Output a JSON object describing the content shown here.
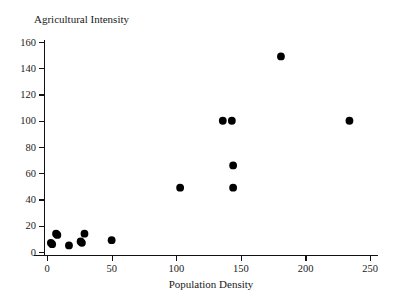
{
  "chart_data": {
    "type": "scatter",
    "title": "",
    "xlabel": "Population Density",
    "ylabel": "Agricultural Intensity",
    "xlim": [
      -10,
      258
    ],
    "ylim": [
      -4,
      164
    ],
    "xticks": [
      0,
      50,
      100,
      150,
      200,
      250
    ],
    "yticks": [
      0,
      20,
      40,
      60,
      80,
      100,
      120,
      140,
      160
    ],
    "xtick_labels": [
      "0",
      "50",
      "100",
      "150",
      "200",
      "250"
    ],
    "ytick_labels": [
      "0",
      "20",
      "40",
      "60",
      "80",
      "100",
      "120",
      "140",
      "160"
    ],
    "grid": false,
    "legend": null,
    "marker": "filled-circle",
    "marker_color": "#000000",
    "marker_size": 5.2,
    "points": [
      {
        "x": 3,
        "y": 7
      },
      {
        "x": 4,
        "y": 6
      },
      {
        "x": 7,
        "y": 14
      },
      {
        "x": 8,
        "y": 13
      },
      {
        "x": 17,
        "y": 5
      },
      {
        "x": 26,
        "y": 8
      },
      {
        "x": 27,
        "y": 7
      },
      {
        "x": 29,
        "y": 14
      },
      {
        "x": 50,
        "y": 9
      },
      {
        "x": 103,
        "y": 49
      },
      {
        "x": 136,
        "y": 100
      },
      {
        "x": 143,
        "y": 100
      },
      {
        "x": 144,
        "y": 66
      },
      {
        "x": 144,
        "y": 49
      },
      {
        "x": 181,
        "y": 149
      },
      {
        "x": 234,
        "y": 100
      }
    ]
  },
  "axes": {
    "y_title": "Agricultural Intensity",
    "x_title": "Population Density"
  }
}
